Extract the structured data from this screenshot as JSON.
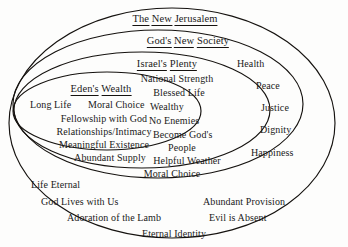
{
  "diagram": {
    "type": "nested-ellipses",
    "background_color": "#fdfdfc",
    "stroke_color": "#15120f",
    "rings": [
      {
        "id": "new-jerusalem",
        "title": "The New Jerusalem",
        "title_words": [
          "The",
          "New",
          "Jerusalem"
        ],
        "items": [
          "Life Eternal",
          "God Lives with Us",
          "Abundant Provision",
          "Adoration of the Lamb",
          "Evil is Absent",
          "Eternal Identity"
        ]
      },
      {
        "id": "gods-new-society",
        "title": "God's New Society",
        "title_words": [
          "God's",
          "New",
          "Society"
        ],
        "items": [
          "Health",
          "Peace",
          "Justice",
          "Dignity",
          "Happiness"
        ]
      },
      {
        "id": "israels-plenty",
        "title": "Israel's Plenty",
        "title_words": [
          "Israel's",
          "Plenty"
        ],
        "items": [
          "National Strength",
          "Blessed Life",
          "Wealthy",
          "No Enemies",
          "Become God's",
          "People",
          "Helpful Weather",
          "Moral Choice"
        ]
      },
      {
        "id": "edens-wealth",
        "title": "Eden's Wealth",
        "title_words": [
          "Eden's",
          "Wealth"
        ],
        "items": [
          "Long Life",
          "Moral Choice",
          "Fellowship with God",
          "Relationships/Intimacy",
          "Meaningful Existence",
          "Abundant Supply"
        ]
      }
    ]
  }
}
